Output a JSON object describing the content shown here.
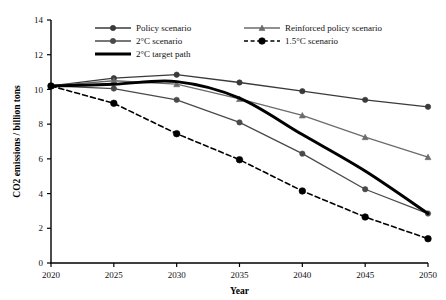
{
  "chart_data": {
    "type": "line",
    "title": "",
    "xlabel": "Year",
    "ylabel": "CO2 emissions / billion tons",
    "x": [
      2020,
      2025,
      2030,
      2035,
      2040,
      2045,
      2050
    ],
    "xlim": [
      2020,
      2050
    ],
    "ylim": [
      0,
      14
    ],
    "x_ticks": [
      "2020",
      "2025",
      "2030",
      "2035",
      "2040",
      "2045",
      "2050"
    ],
    "y_ticks": [
      "0",
      "2",
      "4",
      "6",
      "8",
      "10",
      "12",
      "14"
    ],
    "grid": false,
    "legend_position": "top-inside",
    "series": [
      {
        "name": "Policy scenario",
        "values": [
          10.2,
          10.65,
          10.85,
          10.4,
          9.9,
          9.4,
          9.0
        ],
        "color": "#3a3a3a",
        "marker": "circle",
        "dash": "none",
        "width": 1.3
      },
      {
        "name": "Reinforced policy scenario",
        "values": [
          10.2,
          10.5,
          10.3,
          9.45,
          8.5,
          7.25,
          6.1
        ],
        "color": "#6b6b6b",
        "marker": "triangle",
        "dash": "none",
        "width": 1.3
      },
      {
        "name": "2°C scenario",
        "values": [
          10.2,
          10.05,
          9.4,
          8.1,
          6.3,
          4.25,
          2.85
        ],
        "color": "#4a4a4a",
        "marker": "circle",
        "dash": "none",
        "width": 1.3
      },
      {
        "name": "1.5°C scenario",
        "values": [
          10.2,
          9.2,
          7.45,
          5.95,
          4.15,
          2.65,
          1.4
        ],
        "color": "#000000",
        "marker": "circle",
        "dash": "dashed",
        "width": 1.6
      },
      {
        "name": "2°C target path",
        "values": [
          10.2,
          10.3,
          10.45,
          9.5,
          7.4,
          5.3,
          2.85
        ],
        "color": "#000000",
        "marker": "none",
        "dash": "none",
        "width": 3.0
      }
    ]
  },
  "legend": {
    "items": [
      {
        "label": "Policy scenario",
        "marker": "circle",
        "dash": "none",
        "color": "#3a3a3a"
      },
      {
        "label": "Reinforced policy scenario",
        "marker": "triangle",
        "dash": "none",
        "color": "#6b6b6b"
      },
      {
        "label": "2°C scenario",
        "marker": "circle",
        "dash": "none",
        "color": "#4a4a4a"
      },
      {
        "label": "1.5°C scenario",
        "marker": "circle",
        "dash": "dashed",
        "color": "#000000"
      },
      {
        "label": "2°C target path",
        "marker": "none",
        "dash": "none",
        "color": "#000000"
      }
    ]
  },
  "axes": {
    "x_title": "Year",
    "y_title": "CO2 emissions / billion tons"
  }
}
